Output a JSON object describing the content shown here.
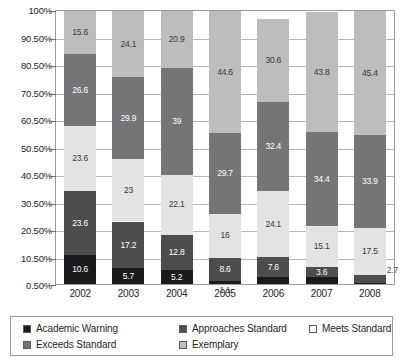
{
  "chart_data": {
    "type": "bar",
    "subtype": "stacked-bar-100",
    "title": "",
    "xlabel": "",
    "ylabel": "",
    "categories": [
      "2002",
      "2003",
      "2004",
      "2005",
      "2006",
      "2007",
      "2008"
    ],
    "ylim": [
      0.5,
      100
    ],
    "ytick_labels": [
      "100%",
      "90.50%",
      "80.50%",
      "70.50%",
      "60.50%",
      "50.50%",
      "40.50%",
      "30.50%",
      "20.50%",
      "10.50%",
      "0.50%"
    ],
    "ytick_values": [
      100,
      90.5,
      80.5,
      70.5,
      60.5,
      50.5,
      40.5,
      30.5,
      20.5,
      10.5,
      0.5
    ],
    "grid": true,
    "legend_position": "bottom",
    "stack_order_bottom_to_top": [
      "Academic Warning",
      "Approaches Standard",
      "Meets Standard",
      "Exceeds Standard",
      "Exemplary"
    ],
    "series": [
      {
        "name": "Academic Warning",
        "color": "#1a1a1a",
        "label_color": "#ffffff",
        "values": [
          10.6,
          5.7,
          5.2,
          1.1,
          2.4,
          2.6,
          0.5
        ],
        "value_labels": [
          "10.6",
          "5.7",
          "5.2",
          "1.1",
          "2.4",
          "2.6",
          "0.5"
        ]
      },
      {
        "name": "Approaches Standard",
        "color": "#4d4d4d",
        "label_color": "#ffffff",
        "values": [
          23.6,
          17.2,
          12.8,
          8.6,
          7.6,
          3.6,
          2.7
        ],
        "value_labels": [
          "23.6",
          "17.2",
          "12.8",
          "8.6",
          "7.6",
          "3.6",
          "2.7"
        ]
      },
      {
        "name": "Meets Standard",
        "color": "#e3e3e3",
        "label_color": "#3a3a3a",
        "values": [
          23.6,
          23.0,
          22.1,
          16.0,
          24.1,
          15.1,
          17.5
        ],
        "value_labels": [
          "23.6",
          "23",
          "22.1",
          "16",
          "24.1",
          "15.1",
          "17.5"
        ]
      },
      {
        "name": "Exceeds Standard",
        "color": "#757575",
        "label_color": "#ffffff",
        "values": [
          26.6,
          29.9,
          39.0,
          29.7,
          32.4,
          34.4,
          33.9
        ],
        "value_labels": [
          "26.6",
          "29.9",
          "39",
          "29.7",
          "32.4",
          "34.4",
          "33.9"
        ]
      },
      {
        "name": "Exemplary",
        "color": "#bdbdbd",
        "label_color": "#3a3a3a",
        "values": [
          15.6,
          24.1,
          20.9,
          44.6,
          30.6,
          43.8,
          45.4
        ],
        "value_labels": [
          "15.6",
          "24.1",
          "20.9",
          "44.6",
          "30.6",
          "43.8",
          "45.4"
        ]
      }
    ],
    "outside_labels": [
      {
        "text": "1.1",
        "category": "2005",
        "series": "Academic Warning",
        "placement": "below-axis"
      },
      {
        "text": "2.7",
        "category": "2008",
        "series": "Approaches Standard",
        "placement": "right-of-bar"
      }
    ]
  },
  "legend": {
    "items": [
      {
        "label": "Academic Warning",
        "color": "#1a1a1a"
      },
      {
        "label": "Approaches Standard",
        "color": "#4d4d4d"
      },
      {
        "label": "Meets Standard",
        "color": "#fdfdfd"
      },
      {
        "label": "Exceeds Standard",
        "color": "#757575"
      },
      {
        "label": "Exemplary",
        "color": "#bdbdbd"
      }
    ]
  }
}
